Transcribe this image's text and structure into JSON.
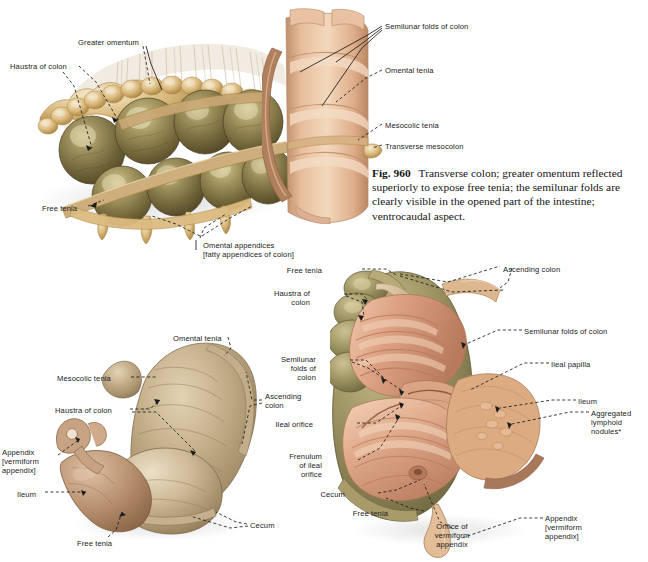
{
  "page": {
    "width": 648,
    "height": 562,
    "background": "#ffffff"
  },
  "caption": {
    "fig_number": "Fig. 960",
    "text": "Transverse colon; greater omentum reflected superiorly to expose free tenia; the semilunar folds are clearly visible in the opened part of the intestine; ventrocaudal aspect."
  },
  "figure_top": {
    "name": "transverse-colon-greater-omentum",
    "labels": [
      {
        "id": "haustra-of-colon",
        "text": "Haustra of colon",
        "x": 10,
        "y": 62,
        "align": "left"
      },
      {
        "id": "greater-omentum",
        "text": "Greater omentum",
        "x": 78,
        "y": 38,
        "align": "left"
      },
      {
        "id": "free-tenia",
        "text": "Free tenia",
        "x": 42,
        "y": 204,
        "align": "left"
      },
      {
        "id": "omental-appendices",
        "text": "Omental appendices\n[fatty appendices of colon]",
        "x": 203,
        "y": 241,
        "align": "left"
      },
      {
        "id": "semilunar-folds",
        "text": "Semilunar folds of colon",
        "x": 385,
        "y": 22,
        "align": "left"
      },
      {
        "id": "omental-tenia",
        "text": "Omental tenia",
        "x": 385,
        "y": 66,
        "align": "left"
      },
      {
        "id": "mesocolic-tenia",
        "text": "Mesocolic tenia",
        "x": 385,
        "y": 121,
        "align": "left"
      },
      {
        "id": "transverse-mesocolon",
        "text": "Transverse mesocolon",
        "x": 385,
        "y": 142,
        "align": "left"
      }
    ]
  },
  "figure_bottom_left": {
    "name": "cecum-closed-ventral-aspect",
    "labels": [
      {
        "id": "omental-tenia",
        "text": "Omental tenia",
        "x": 173,
        "y": 334,
        "align": "left"
      },
      {
        "id": "mesocolic-tenia",
        "text": "Mesocolic tenia",
        "x": 57,
        "y": 374,
        "align": "left"
      },
      {
        "id": "haustra-of-colon",
        "text": "Haustra of colon",
        "x": 55,
        "y": 406,
        "align": "left"
      },
      {
        "id": "appendix",
        "text": "Appendix\n[vermiform\nappendix]",
        "x": 2,
        "y": 448,
        "align": "left"
      },
      {
        "id": "ileum",
        "text": "Ileum",
        "x": 17,
        "y": 490,
        "align": "left"
      },
      {
        "id": "ascending-colon",
        "text": "Ascending\ncolon",
        "x": 265,
        "y": 392,
        "align": "left"
      },
      {
        "id": "cecum",
        "text": "Cecum",
        "x": 250,
        "y": 521,
        "align": "left"
      },
      {
        "id": "free-tenia",
        "text": "Free tenia",
        "x": 77,
        "y": 539,
        "align": "left"
      }
    ]
  },
  "figure_bottom_right": {
    "name": "cecum-opened-ileal-orifice",
    "labels": [
      {
        "id": "free-tenia-top",
        "text": "Free tenia",
        "x": 322,
        "y": 266,
        "align": "left"
      },
      {
        "id": "haustra-of-colon",
        "text": "Haustra of\ncolon",
        "x": 304,
        "y": 289,
        "align": "left"
      },
      {
        "id": "semilunar-folds-left",
        "text": "Semilunar\nfolds of\ncolon",
        "x": 310,
        "y": 355,
        "align": "left"
      },
      {
        "id": "ileal-orifice",
        "text": "Ileal orifice",
        "x": 313,
        "y": 420,
        "align": "left"
      },
      {
        "id": "frenulum-ileal",
        "text": "Frenulum\nof ileal\norifice",
        "x": 322,
        "y": 452,
        "align": "left"
      },
      {
        "id": "cecum",
        "text": "Cecum",
        "x": 345,
        "y": 490,
        "align": "left"
      },
      {
        "id": "free-tenia-bottom",
        "text": "Free tenia",
        "x": 388,
        "y": 509,
        "align": "left"
      },
      {
        "id": "orifice-vermiform",
        "text": "Orifice of\nvermiform\nappendix",
        "x": 427,
        "y": 522,
        "align": "left"
      },
      {
        "id": "ascending-colon",
        "text": "Ascending colon",
        "x": 503,
        "y": 265,
        "align": "left"
      },
      {
        "id": "semilunar-folds-right",
        "text": "Semilunar folds of colon",
        "x": 524,
        "y": 327,
        "align": "left"
      },
      {
        "id": "ileal-papilla",
        "text": "Ileal papilla",
        "x": 551,
        "y": 360,
        "align": "left"
      },
      {
        "id": "ileum",
        "text": "Ileum",
        "x": 578,
        "y": 397,
        "align": "left"
      },
      {
        "id": "aggregated-lymphoid",
        "text": "Aggregated\nlymphoid\nnodules*",
        "x": 591,
        "y": 409,
        "align": "left"
      },
      {
        "id": "appendix",
        "text": "Appendix\n[vermiform\nappendix]",
        "x": 545,
        "y": 514,
        "align": "left"
      }
    ]
  },
  "palette": {
    "haustra_olive_dark": "#5e5431",
    "haustra_olive_mid": "#7d7048",
    "haustra_olive_light": "#9a8c5e",
    "omentum_tan": "#d9b779",
    "omentum_tan_dark": "#b08f4e",
    "omentum_pale": "#efdcb4",
    "mucosa_pink": "#d79a7c",
    "mucosa_pink_light": "#e9bda2",
    "mucosa_pink_dark": "#b97a5e",
    "serosa_tan": "#c9b28a",
    "serosa_tan_light": "#ddc9a6",
    "cecum_beige": "#c2ae8c",
    "cecum_beige_dark": "#9d8864",
    "ileum_brown": "#b08868",
    "leader_line": "#1b1b1b",
    "text": "#1b1b1b"
  }
}
